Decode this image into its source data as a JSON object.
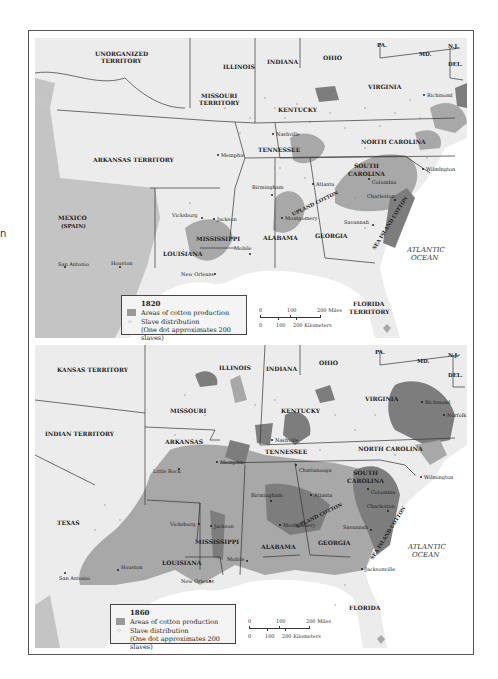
{
  "stray_text": "n",
  "colors": {
    "land": "#ececec",
    "mexico_land": "#c4c4c4",
    "water": "#ffffff",
    "cotton_light": "#a8a8a8",
    "cotton_dark": "#7d7d7d",
    "border": "#333333",
    "dots": "#8a8a8a"
  },
  "maps": [
    {
      "year": "1820",
      "labels": [
        {
          "text": "UNORGANIZED",
          "x": 60,
          "y": 18
        },
        {
          "text": "TERRITORY",
          "x": 66,
          "y": 25
        },
        {
          "text": "MISSOURI",
          "x": 166,
          "y": 60
        },
        {
          "text": "TERRITORY",
          "x": 164,
          "y": 67
        },
        {
          "text": "ILLINOIS",
          "x": 213,
          "y": 31
        },
        {
          "text": "INDIANA",
          "x": 260,
          "y": 26
        },
        {
          "text": "OHIO",
          "x": 313,
          "y": 22
        },
        {
          "text": "KENTUCKY",
          "x": 271,
          "y": 74
        },
        {
          "text": "VIRGINIA",
          "x": 363,
          "y": 51
        },
        {
          "text": "PA.",
          "x": 367,
          "y": 9
        },
        {
          "text": "MD.",
          "x": 409,
          "y": 18
        },
        {
          "text": "N.J.",
          "x": 440,
          "y": 10
        },
        {
          "text": "DEL.",
          "x": 440,
          "y": 28
        },
        {
          "text": "TENNESSEE",
          "x": 252,
          "y": 114
        },
        {
          "text": "NORTH CAROLINA",
          "x": 355,
          "y": 106
        },
        {
          "text": "ARKANSAS TERRITORY",
          "x": 88,
          "y": 124
        },
        {
          "text": "SOUTH",
          "x": 347,
          "y": 130
        },
        {
          "text": "CAROLINA",
          "x": 342,
          "y": 138
        },
        {
          "text": "MEXICO",
          "x": 51,
          "y": 182
        },
        {
          "text": "(SPAIN)",
          "x": 54,
          "y": 190
        },
        {
          "text": "MISSISSIPPI",
          "x": 189,
          "y": 203
        },
        {
          "text": "ALABAMA",
          "x": 258,
          "y": 202
        },
        {
          "text": "GEORGIA",
          "x": 309,
          "y": 200
        },
        {
          "text": "LOUISIANA",
          "x": 156,
          "y": 218
        },
        {
          "text": "FLORIDA",
          "x": 348,
          "y": 268
        },
        {
          "text": "TERRITORY",
          "x": 344,
          "y": 276
        }
      ],
      "cities": [
        {
          "name": "Nashville",
          "x": 272,
          "y": 96
        },
        {
          "name": "Memphis",
          "x": 215,
          "y": 117
        },
        {
          "name": "Wilmington",
          "x": 422,
          "y": 131
        },
        {
          "name": "Birmingham",
          "x": 251,
          "y": 148
        },
        {
          "name": "Atlanta",
          "x": 311,
          "y": 146
        },
        {
          "name": "Columbia",
          "x": 368,
          "y": 145
        },
        {
          "name": "Charleston",
          "x": 366,
          "y": 161
        },
        {
          "name": "Vicksburg",
          "x": 169,
          "y": 179
        },
        {
          "name": "Jackson",
          "x": 213,
          "y": 181
        },
        {
          "name": "Montgomery",
          "x": 281,
          "y": 180
        },
        {
          "name": "Savannah",
          "x": 343,
          "y": 185
        },
        {
          "name": "Mobile",
          "x": 231,
          "y": 212
        },
        {
          "name": "San Antonio",
          "x": 58,
          "y": 227
        },
        {
          "name": "Houston",
          "x": 112,
          "y": 226
        },
        {
          "name": "New Orleans",
          "x": 179,
          "y": 236
        },
        {
          "name": "Richmond",
          "x": 423,
          "y": 56
        }
      ],
      "rotated_labels": [
        {
          "text": "UPLAND COTTON",
          "x": 292,
          "y": 177,
          "angle": -26
        },
        {
          "text": "SEA ISLAND COTTON",
          "x": 373,
          "y": 210,
          "angle": -58
        }
      ],
      "ocean": {
        "line1": "ATLANTIC",
        "line2": "OCEAN",
        "x": 400,
        "y": 214
      },
      "legend": {
        "year": "1820",
        "cotton": "Areas of cotton production",
        "slave_line1": "Slave distribution",
        "slave_line2": "(One dot approximates 200 slaves)"
      },
      "scale": {
        "miles_ticks": [
          "0",
          "100",
          "200 Miles"
        ],
        "km_ticks": [
          "0",
          "100",
          "200 Kilometers"
        ]
      }
    },
    {
      "year": "1860",
      "labels": [
        {
          "text": "KANSAS TERRITORY",
          "x": 22,
          "y": 27
        },
        {
          "text": "ILLINOIS",
          "x": 184,
          "y": 25
        },
        {
          "text": "INDIANA",
          "x": 231,
          "y": 26
        },
        {
          "text": "OHIO",
          "x": 284,
          "y": 20
        },
        {
          "text": "PA.",
          "x": 340,
          "y": 9
        },
        {
          "text": "MD.",
          "x": 382,
          "y": 18
        },
        {
          "text": "N.J.",
          "x": 413,
          "y": 12
        },
        {
          "text": "DEL.",
          "x": 413,
          "y": 32
        },
        {
          "text": "MISSOURI",
          "x": 135,
          "y": 68
        },
        {
          "text": "KENTUCKY",
          "x": 246,
          "y": 68
        },
        {
          "text": "VIRGINIA",
          "x": 330,
          "y": 56
        },
        {
          "text": "INDIAN TERRITORY",
          "x": 10,
          "y": 91
        },
        {
          "text": "ARKANSAS",
          "x": 130,
          "y": 99
        },
        {
          "text": "TENNESSEE",
          "x": 230,
          "y": 109
        },
        {
          "text": "NORTH CAROLINA",
          "x": 323,
          "y": 106
        },
        {
          "text": "SOUTH",
          "x": 318,
          "y": 130
        },
        {
          "text": "CAROLINA",
          "x": 312,
          "y": 138
        },
        {
          "text": "TEXAS",
          "x": 22,
          "y": 180
        },
        {
          "text": "MISSISSIPPI",
          "x": 160,
          "y": 199
        },
        {
          "text": "ALABAMA",
          "x": 226,
          "y": 204
        },
        {
          "text": "GEORGIA",
          "x": 283,
          "y": 200
        },
        {
          "text": "LOUISIANA",
          "x": 127,
          "y": 220
        },
        {
          "text": "FLORIDA",
          "x": 314,
          "y": 265
        }
      ],
      "cities": [
        {
          "name": "Richmond",
          "x": 387,
          "y": 57
        },
        {
          "name": "Norfolk",
          "x": 409,
          "y": 70
        },
        {
          "name": "Nashville",
          "x": 237,
          "y": 95
        },
        {
          "name": "Memphis",
          "x": 182,
          "y": 117
        },
        {
          "name": "Little Rock",
          "x": 144,
          "y": 124
        },
        {
          "name": "Chattanooga",
          "x": 261,
          "y": 120
        },
        {
          "name": "Wilmington",
          "x": 386,
          "y": 132
        },
        {
          "name": "Columbia",
          "x": 333,
          "y": 144
        },
        {
          "name": "Birmingham",
          "x": 236,
          "y": 156
        },
        {
          "name": "Atlanta",
          "x": 276,
          "y": 150
        },
        {
          "name": "Charleston",
          "x": 353,
          "y": 166
        },
        {
          "name": "Vicksburg",
          "x": 164,
          "y": 179
        },
        {
          "name": "Jackson",
          "x": 176,
          "y": 181
        },
        {
          "name": "Montgomery",
          "x": 245,
          "y": 180
        },
        {
          "name": "Savannah",
          "x": 336,
          "y": 185
        },
        {
          "name": "Mobile",
          "x": 212,
          "y": 216
        },
        {
          "name": "Jacksonville",
          "x": 327,
          "y": 224
        },
        {
          "name": "San Antonio",
          "x": 28,
          "y": 230
        },
        {
          "name": "Houston",
          "x": 83,
          "y": 225
        },
        {
          "name": "New Orleans",
          "x": 175,
          "y": 236
        }
      ],
      "rotated_labels": [
        {
          "text": "UPLAND COTTON",
          "x": 259,
          "y": 177,
          "angle": -26
        },
        {
          "text": "SEA ISLAND COTTON",
          "x": 338,
          "y": 210,
          "angle": -58
        }
      ],
      "ocean": {
        "line1": "ATLANTIC",
        "line2": "OCEAN",
        "x": 398,
        "y": 204
      },
      "legend": {
        "year": "1860",
        "cotton": "Areas of cotton production",
        "slave_line1": "Slave distribution",
        "slave_line2": "(One dot approximates 200 slaves)"
      },
      "scale": {
        "miles_ticks": [
          "0",
          "100",
          "200 Miles"
        ],
        "km_ticks": [
          "0",
          "100",
          "200 Kilometers"
        ]
      }
    }
  ]
}
